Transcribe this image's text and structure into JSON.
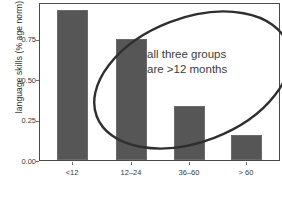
{
  "chart_data": {
    "type": "bar",
    "title": "",
    "subtitle": "",
    "xlabel": "",
    "ylabel": "language skills (% age norm)",
    "categories": [
      "<12",
      "12–24",
      "36–60",
      "> 60"
    ],
    "values": [
      0.94,
      0.755,
      0.34,
      0.155
    ],
    "series": [
      {
        "name": "language skills",
        "values": [
          0.94,
          0.755,
          0.34,
          0.155
        ]
      }
    ],
    "ylim": [
      0.0,
      0.975
    ],
    "yticks": [
      0.0,
      0.25,
      0.5,
      0.75
    ],
    "ytick_labels": [
      "0.00",
      "0.25",
      "0.50",
      "0.75"
    ],
    "grid": false,
    "legend": null,
    "bar_color": "#565656",
    "frame_color": "#4a4a4a",
    "background": "#ffffff",
    "annotations": [
      {
        "name": "ellipse-callout",
        "shape": "ellipse",
        "line1": "all three groups",
        "line2": "are >12 months",
        "color": "#3c3c3c",
        "stroke": "#2f2f2f"
      }
    ]
  },
  "axes": {
    "y_title": "language skills (% age norm)",
    "y_ticks": [
      {
        "label": "0.75",
        "value": 0.75
      },
      {
        "label": "0.50",
        "value": 0.5
      },
      {
        "label": "0.25",
        "value": 0.25
      },
      {
        "label": "0.00",
        "value": 0.0
      }
    ],
    "x_ticks": [
      {
        "label": "<12"
      },
      {
        "label": "12–24"
      },
      {
        "label": "36–60"
      },
      {
        "label": "> 60"
      }
    ]
  },
  "annotation": {
    "line1": "all three groups",
    "line2": "are >12 months"
  }
}
